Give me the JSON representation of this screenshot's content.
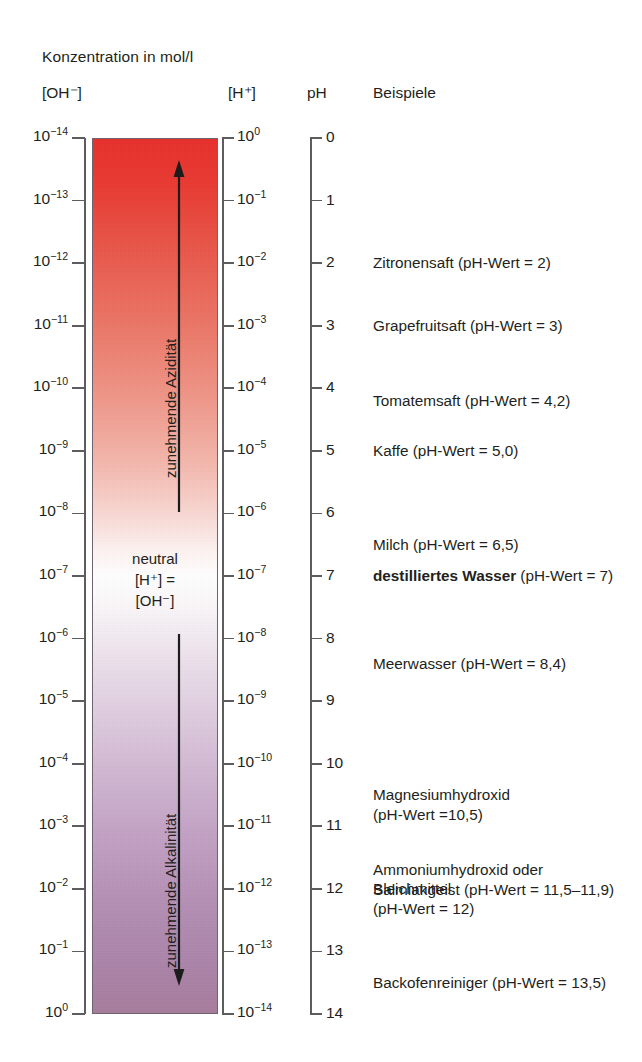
{
  "headings": {
    "concentration": "Konzentration in mol/l",
    "oh_axis": "[OH⁻]",
    "h_axis": "[H⁺]",
    "ph_axis": "pH",
    "examples": "Beispiele"
  },
  "region_labels": {
    "acidity": "zunehmende Azidität",
    "alkalinity": "zunehmende Alkalinität"
  },
  "neutral_block": {
    "line1": "neutral",
    "line2": "[H⁺] =",
    "line3": "[OH⁻]"
  },
  "colors": {
    "acid_top": "#e8302c",
    "neutral_mid": "#ffffff",
    "alkaline_bottom": "#a87d9d",
    "axis": "#5d5d60",
    "text": "#231f20",
    "bar_border": "#6e6470"
  },
  "chart_data": {
    "type": "bar",
    "orientation": "vertical",
    "grid": false,
    "ylabel": "pH",
    "ylim": [
      0,
      14
    ],
    "ph_ticks": [
      "0",
      "1",
      "2",
      "3",
      "4",
      "5",
      "6",
      "7",
      "8",
      "9",
      "10",
      "11",
      "12",
      "13",
      "14"
    ],
    "oh_exponents": [
      -14,
      -13,
      -12,
      -11,
      -10,
      -9,
      -8,
      -7,
      -6,
      -5,
      -4,
      -3,
      -2,
      -1,
      0
    ],
    "h_exponents": [
      0,
      -1,
      -2,
      -3,
      -4,
      -5,
      -6,
      -7,
      -8,
      -9,
      -10,
      -11,
      -12,
      -13,
      -14
    ],
    "oh_ticks": [
      "10⁻¹⁴",
      "10⁻¹³",
      "10⁻¹²",
      "10⁻¹¹",
      "10⁻¹⁰",
      "10⁻⁹",
      "10⁻⁸",
      "10⁻⁷",
      "10⁻⁶",
      "10⁻⁵",
      "10⁻⁴",
      "10⁻³",
      "10⁻²",
      "10⁻¹",
      "10⁰"
    ],
    "h_ticks": [
      "10⁰",
      "10⁻¹",
      "10⁻²",
      "10⁻³",
      "10⁻⁴",
      "10⁻⁵",
      "10⁻⁶",
      "10⁻⁷",
      "10⁻⁸",
      "10⁻⁹",
      "10⁻¹⁰",
      "10⁻¹¹",
      "10⁻¹²",
      "10⁻¹³",
      "10⁻¹⁴"
    ],
    "examples": [
      {
        "ph": 2,
        "text": "Zitronensaft (pH-Wert = 2)",
        "bold_prefix": ""
      },
      {
        "ph": 3,
        "text": "Grapefruitsaft (pH-Wert = 3)",
        "bold_prefix": ""
      },
      {
        "ph": 4.2,
        "text": "Tomatemsaft (pH-Wert = 4,2)",
        "bold_prefix": ""
      },
      {
        "ph": 5.0,
        "text": "Kaffe (pH-Wert = 5,0)",
        "bold_prefix": ""
      },
      {
        "ph": 6.5,
        "text": "Milch (pH-Wert = 6,5)",
        "bold_prefix": ""
      },
      {
        "ph": 7,
        "text": " (pH-Wert = 7)",
        "bold_prefix": "destilliertes Wasser"
      },
      {
        "ph": 8.4,
        "text": "Meerwasser (pH-Wert = 8,4)",
        "bold_prefix": ""
      },
      {
        "ph": 10.5,
        "text": "Magnesiumhydroxid\n(pH-Wert =10,5)",
        "bold_prefix": ""
      },
      {
        "ph": 11.7,
        "text": "Ammoniumhydroxid oder\nSalmiakgeist (pH-Wert = 11,5–11,9)",
        "bold_prefix": ""
      },
      {
        "ph": 12,
        "text": "Bleichmittel\n(pH-Wert = 12)",
        "bold_prefix": ""
      },
      {
        "ph": 13.5,
        "text": "Backofenreiniger (pH-Wert = 13,5)",
        "bold_prefix": ""
      }
    ]
  }
}
